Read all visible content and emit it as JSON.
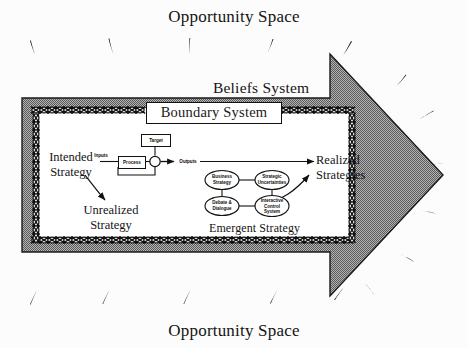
{
  "figure": {
    "title_top": "Opportunity Space",
    "title_bottom": "Opportunity Space",
    "beliefs_system": "Beliefs System",
    "boundary_system": "Boundary System"
  },
  "flow": {
    "intended_strategy": "Intended\nStrategy",
    "intended_strategy_line1": "Intended",
    "intended_strategy_line2": "Strategy",
    "unrealized_strategy_line1": "Unrealized",
    "unrealized_strategy_line2": "Strategy",
    "realized_strategies_line1": "Realized",
    "realized_strategies_line2": "Strategies",
    "emergent_strategy": "Emergent Strategy"
  },
  "process_model": {
    "target": "Target",
    "inputs": "Inputs",
    "process": "Process",
    "outputs": "Outputs"
  },
  "interactive_control": {
    "ovals": [
      {
        "id": "business-strategy",
        "line1": "Business",
        "line2": "Strategy"
      },
      {
        "id": "strategic-uncertainties",
        "line1": "Strategic",
        "line2": "Uncertainties"
      },
      {
        "id": "debate-dialogue",
        "line1": "Debate &",
        "line2": "Dialogue"
      },
      {
        "id": "interactive-control-system",
        "line1": "Interactive",
        "line2": "Control",
        "line3": "System"
      }
    ]
  },
  "colors": {
    "background": "#fcfcfc",
    "arrow_fill": "#8e8e8e",
    "arrow_stroke": "#1a1a1a",
    "ink": "#141414",
    "panel_fill": "#ffffff"
  },
  "decor": {
    "ray_count_top": 5,
    "ray_count_bottom": 5,
    "ray_count_right": 6,
    "description": "radiating tapered tick marks surrounding the arrow"
  }
}
